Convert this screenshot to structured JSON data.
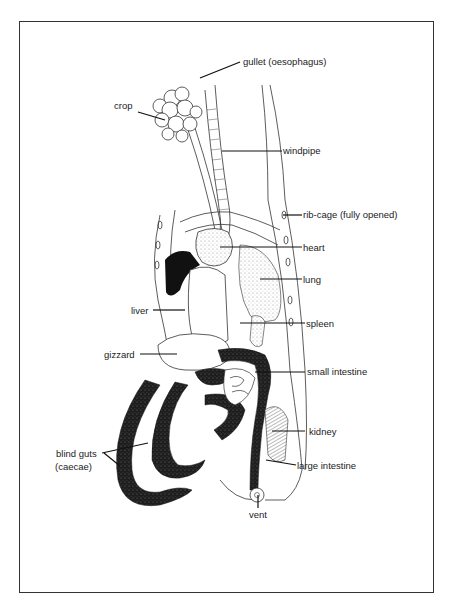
{
  "diagram": {
    "labels": {
      "gullet": "gullet (oesophagus)",
      "crop": "crop",
      "windpipe": "windpipe",
      "rib_cage": "rib-cage (fully opened)",
      "heart": "heart",
      "lung": "lung",
      "liver": "liver",
      "spleen": "spleen",
      "gizzard": "gizzard",
      "small_intestine": "small intestine",
      "kidney": "kidney",
      "blind_guts_line1": "blind guts",
      "blind_guts_line2": "(caecae)",
      "large_intestine": "large intestine",
      "vent": "vent"
    },
    "colors": {
      "ink": "#222222",
      "dark_organ": "#1a1a1a",
      "stipple": "#777777",
      "background": "#ffffff"
    }
  }
}
